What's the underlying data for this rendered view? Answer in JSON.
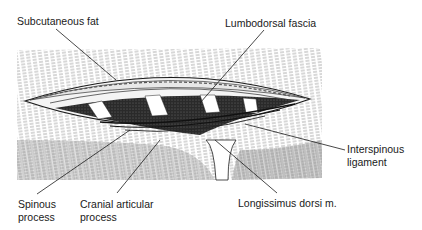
{
  "figure": {
    "labels": {
      "subcutaneous_fat": "Subcutaneous fat",
      "lumbodorsal_fascia": "Lumbodorsal fascia",
      "interspinous_ligament_1": "Interspinous",
      "interspinous_ligament_2": "ligament",
      "spinous_process_1": "Spinous",
      "spinous_process_2": "process",
      "cranial_articular_process_1": "Cranial articular",
      "cranial_articular_process_2": "process",
      "longissimus_dorsi": "Longissimus dorsi m."
    },
    "colors": {
      "ink": "#1a1a1a",
      "paper": "#ffffff",
      "hatch_light": "#d9d9d9",
      "hatch_mid": "#a8a8a8"
    }
  }
}
